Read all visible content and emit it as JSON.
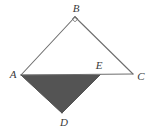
{
  "figure": {
    "background_color": "#ffffff",
    "stroke_color": "#6e6e6e",
    "shade_color": "#545454",
    "label_color": "#3a3a3a",
    "stroke_width": 1.1,
    "canvas": {
      "width": 155,
      "height": 140
    }
  },
  "points": {
    "A": {
      "label": "A",
      "x": 21,
      "y": 75,
      "label_x": 13,
      "label_y": 74
    },
    "B": {
      "label": "B",
      "x": 75,
      "y": 17,
      "label_x": 76,
      "label_y": 8
    },
    "C": {
      "label": "C",
      "x": 133,
      "y": 74,
      "label_x": 141,
      "label_y": 76
    },
    "D": {
      "label": "D",
      "x": 62,
      "y": 113,
      "label_x": 64,
      "label_y": 122
    },
    "E": {
      "label": "E",
      "x": 100,
      "y": 75,
      "label_x": 99,
      "label_y": 65
    }
  },
  "segments": {
    "AB": "A to B",
    "BC": "B to C",
    "AC": "A to C",
    "AD": "A to D",
    "DE": "D to E"
  },
  "shaded_region": {
    "name": "triangle-AED",
    "vertices": "A, E, D",
    "fill": "#545454"
  },
  "markers": {
    "right_angle_at_B": "small square marker at vertex B"
  }
}
